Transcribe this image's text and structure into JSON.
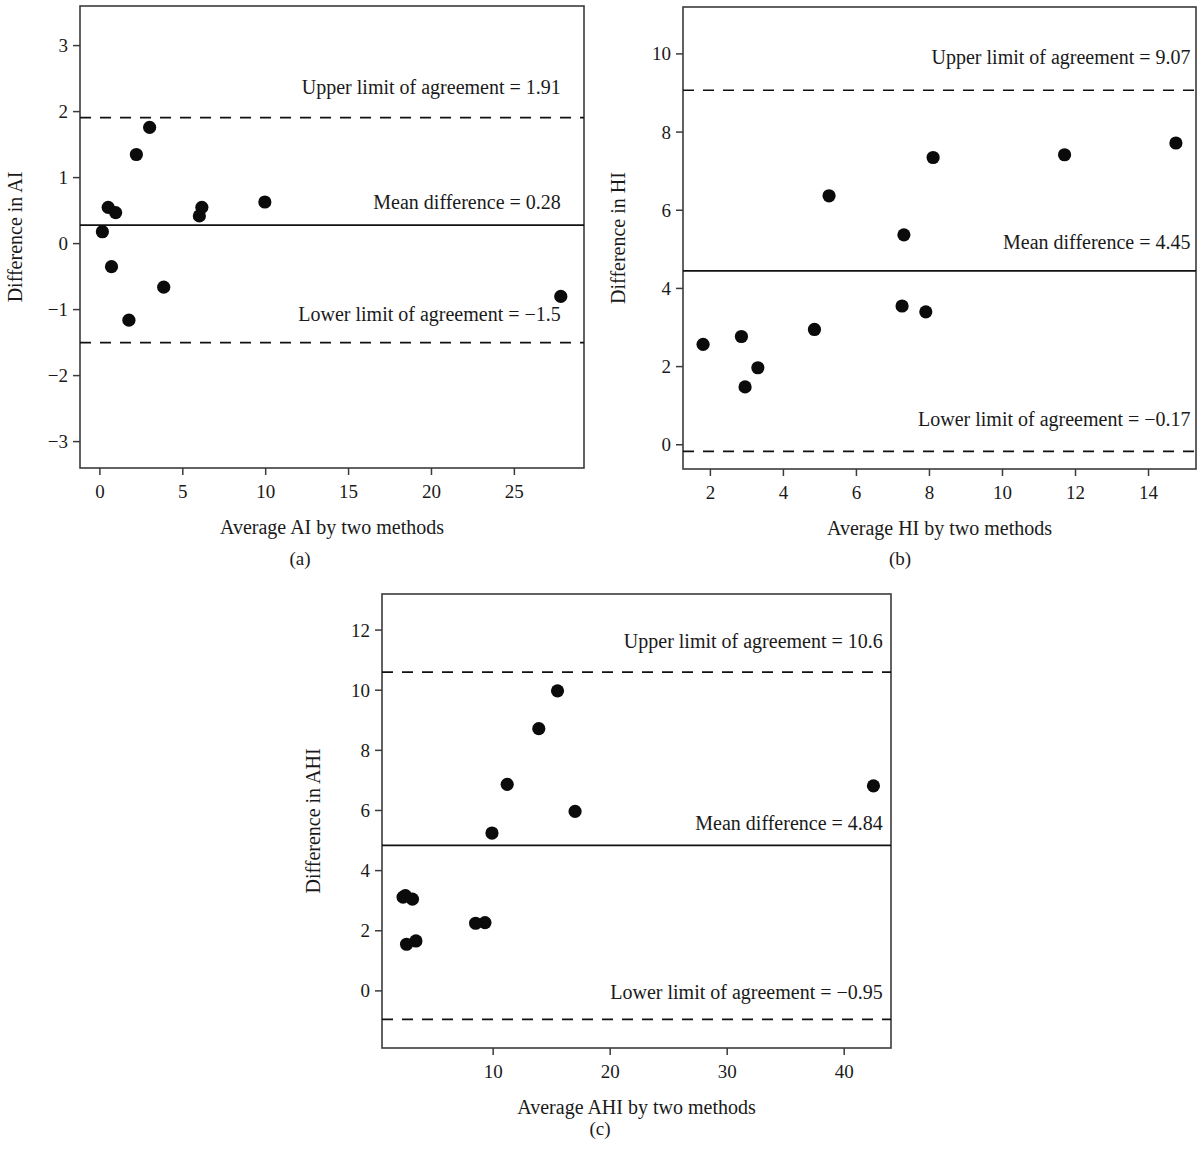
{
  "figure": {
    "panel_captions": [
      "(a)",
      "(b)",
      "(c)"
    ]
  },
  "chart_data": [
    {
      "type": "scatter",
      "panel": "(a)",
      "title": "",
      "xlabel": "Average AI by two methods",
      "ylabel": "Difference in AI",
      "xlim": [
        -1.2,
        29.2
      ],
      "ylim": [
        -3.4,
        3.6
      ],
      "xticks": [
        0,
        5,
        10,
        15,
        20,
        25
      ],
      "xticklabels": [
        "0",
        "5",
        "10",
        "15",
        "20",
        "25"
      ],
      "yticks": [
        3,
        2,
        1,
        0,
        -1,
        -2,
        -3
      ],
      "yticklabels": [
        "3",
        "2",
        "1",
        "0",
        "−1",
        "−2",
        "−3"
      ],
      "grid": false,
      "legend": "none",
      "mean_difference": 0.28,
      "upper_limit": 1.91,
      "lower_limit": -1.5,
      "annotations": [
        {
          "text": "Upper limit of agreement = 1.91",
          "x": 27.8,
          "y": 2.27,
          "anchor": "end"
        },
        {
          "text": "Mean difference = 0.28",
          "x": 27.8,
          "y": 0.52,
          "anchor": "end"
        },
        {
          "text": "Lower limit of agreement = −1.5",
          "x": 27.8,
          "y": -1.17,
          "anchor": "end"
        }
      ],
      "points": [
        {
          "x": 0.15,
          "y": 0.18
        },
        {
          "x": 0.5,
          "y": 0.55
        },
        {
          "x": 0.95,
          "y": 0.47
        },
        {
          "x": 0.7,
          "y": -0.35
        },
        {
          "x": 1.75,
          "y": -1.16
        },
        {
          "x": 2.2,
          "y": 1.35
        },
        {
          "x": 3.0,
          "y": 1.76
        },
        {
          "x": 3.85,
          "y": -0.66
        },
        {
          "x": 6.0,
          "y": 0.42
        },
        {
          "x": 6.15,
          "y": 0.55
        },
        {
          "x": 9.95,
          "y": 0.63
        },
        {
          "x": 27.8,
          "y": -0.8
        }
      ]
    },
    {
      "type": "scatter",
      "panel": "(b)",
      "title": "",
      "xlabel": "Average HI by two methods",
      "ylabel": "Difference in HI",
      "xlim": [
        1.25,
        15.3
      ],
      "ylim": [
        -0.62,
        11.2
      ],
      "xticks": [
        2,
        4,
        6,
        8,
        10,
        12,
        14
      ],
      "xticklabels": [
        "2",
        "4",
        "6",
        "8",
        "10",
        "12",
        "14"
      ],
      "yticks": [
        10,
        8,
        6,
        4,
        2,
        0
      ],
      "yticklabels": [
        "10",
        "8",
        "6",
        "4",
        "2",
        "0"
      ],
      "grid": false,
      "legend": "none",
      "mean_difference": 4.45,
      "upper_limit": 9.07,
      "lower_limit": -0.17,
      "annotations": [
        {
          "text": "Upper limit of agreement = 9.07",
          "x": 15.15,
          "y": 9.75,
          "anchor": "end"
        },
        {
          "text": "Mean difference = 4.45",
          "x": 15.15,
          "y": 5.0,
          "anchor": "end"
        },
        {
          "text": "Lower limit of agreement = −0.17",
          "x": 15.15,
          "y": 0.48,
          "anchor": "end"
        }
      ],
      "points": [
        {
          "x": 1.8,
          "y": 2.57
        },
        {
          "x": 2.85,
          "y": 2.77
        },
        {
          "x": 2.95,
          "y": 1.48
        },
        {
          "x": 3.3,
          "y": 1.97
        },
        {
          "x": 4.85,
          "y": 2.95
        },
        {
          "x": 5.25,
          "y": 6.37
        },
        {
          "x": 7.25,
          "y": 3.55
        },
        {
          "x": 7.3,
          "y": 5.37
        },
        {
          "x": 7.9,
          "y": 3.4
        },
        {
          "x": 8.1,
          "y": 7.35
        },
        {
          "x": 11.7,
          "y": 7.42
        },
        {
          "x": 14.75,
          "y": 7.72
        }
      ]
    },
    {
      "type": "scatter",
      "panel": "(c)",
      "title": "",
      "xlabel": "Average AHI by two methods",
      "ylabel": "Difference in AHI",
      "xlim": [
        0.5,
        44.0
      ],
      "ylim": [
        -1.9,
        13.2
      ],
      "xticks": [
        10,
        20,
        30,
        40
      ],
      "xticklabels": [
        "10",
        "20",
        "30",
        "40"
      ],
      "yticks": [
        12,
        10,
        8,
        6,
        4,
        2,
        0
      ],
      "yticklabels": [
        "12",
        "10",
        "8",
        "6",
        "4",
        "2",
        "0"
      ],
      "grid": false,
      "legend": "none",
      "mean_difference": 4.84,
      "upper_limit": 10.6,
      "lower_limit": -0.95,
      "annotations": [
        {
          "text": "Upper limit of agreement = 10.6",
          "x": 43.3,
          "y": 11.4,
          "anchor": "end"
        },
        {
          "text": "Mean difference = 4.84",
          "x": 43.3,
          "y": 5.35,
          "anchor": "end"
        },
        {
          "text": "Lower limit of agreement = −0.95",
          "x": 43.3,
          "y": -0.28,
          "anchor": "end"
        }
      ],
      "points": [
        {
          "x": 2.3,
          "y": 3.12
        },
        {
          "x": 2.5,
          "y": 3.17
        },
        {
          "x": 2.6,
          "y": 1.55
        },
        {
          "x": 3.1,
          "y": 3.05
        },
        {
          "x": 3.4,
          "y": 1.66
        },
        {
          "x": 8.5,
          "y": 2.25
        },
        {
          "x": 9.3,
          "y": 2.27
        },
        {
          "x": 9.9,
          "y": 5.25
        },
        {
          "x": 11.2,
          "y": 6.87
        },
        {
          "x": 13.9,
          "y": 8.72
        },
        {
          "x": 15.5,
          "y": 9.98
        },
        {
          "x": 17.0,
          "y": 5.97
        },
        {
          "x": 42.5,
          "y": 6.82
        }
      ]
    }
  ]
}
